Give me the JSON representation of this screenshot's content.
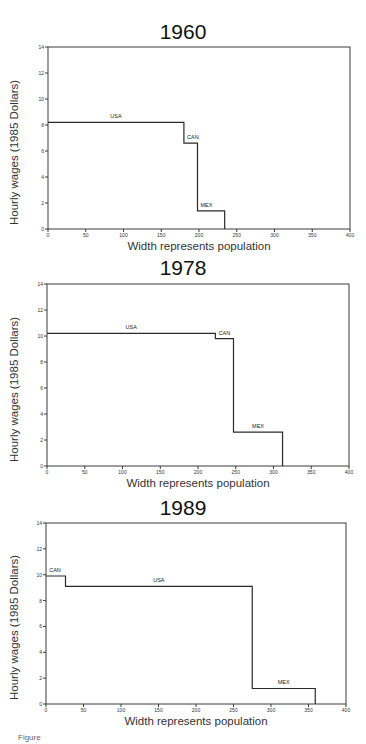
{
  "chart_data": [
    {
      "type": "bar",
      "subtype": "variable-width step chart",
      "title": "1960",
      "xlabel": "Width represents population",
      "ylabel": "Hourly wages (1985 Dollars)",
      "xlim": [
        0,
        400
      ],
      "ylim": [
        0,
        14
      ],
      "xticks": [
        0,
        50,
        100,
        150,
        200,
        250,
        300,
        350,
        400
      ],
      "yticks": [
        0,
        2,
        4,
        6,
        8,
        10,
        12,
        14
      ],
      "grid": false,
      "segments": [
        {
          "label": "USA",
          "x_start": 0,
          "x_end": 180,
          "value": 8.2
        },
        {
          "label": "CAN",
          "x_start": 180,
          "x_end": 198,
          "value": 6.6
        },
        {
          "label": "MEX",
          "x_start": 198,
          "x_end": 234,
          "value": 1.4
        }
      ]
    },
    {
      "type": "bar",
      "subtype": "variable-width step chart",
      "title": "1978",
      "xlabel": "Width represents population",
      "ylabel": "Hourly wages (1985 Dollars)",
      "xlim": [
        0,
        400
      ],
      "ylim": [
        0,
        14
      ],
      "xticks": [
        0,
        50,
        100,
        150,
        200,
        250,
        300,
        350,
        400
      ],
      "yticks": [
        0,
        2,
        4,
        6,
        8,
        10,
        12,
        14
      ],
      "grid": false,
      "segments": [
        {
          "label": "USA",
          "x_start": 0,
          "x_end": 223,
          "value": 10.2
        },
        {
          "label": "CAN",
          "x_start": 223,
          "x_end": 247,
          "value": 9.8
        },
        {
          "label": "MEX",
          "x_start": 247,
          "x_end": 312,
          "value": 2.6
        }
      ]
    },
    {
      "type": "bar",
      "subtype": "variable-width step chart",
      "title": "1989",
      "xlabel": "Width represents population",
      "ylabel": "Hourly wages (1985 Dollars)",
      "xlim": [
        0,
        400
      ],
      "ylim": [
        0,
        14
      ],
      "xticks": [
        0,
        50,
        100,
        150,
        200,
        250,
        300,
        350,
        400
      ],
      "yticks": [
        0,
        2,
        4,
        6,
        8,
        10,
        12,
        14
      ],
      "grid": false,
      "segments": [
        {
          "label": "CAN",
          "x_start": 0,
          "x_end": 26,
          "value": 9.9
        },
        {
          "label": "USA",
          "x_start": 26,
          "x_end": 275,
          "value": 9.1
        },
        {
          "label": "MEX",
          "x_start": 275,
          "x_end": 359,
          "value": 1.2
        }
      ]
    }
  ],
  "layout": {
    "panels": [
      {
        "top": 0,
        "title_y": 20,
        "plot": {
          "x": 48,
          "y": 47,
          "w": 302,
          "h": 182
        }
      },
      {
        "top": 0,
        "title_y": 256,
        "plot": {
          "x": 47,
          "y": 284,
          "w": 302,
          "h": 182
        }
      },
      {
        "top": 0,
        "title_y": 496,
        "plot": {
          "x": 46,
          "y": 523,
          "w": 300,
          "h": 181
        }
      }
    ],
    "line_color": "#2a2a2a",
    "frame_color": "#3a3a3a"
  },
  "caption": "Figure"
}
